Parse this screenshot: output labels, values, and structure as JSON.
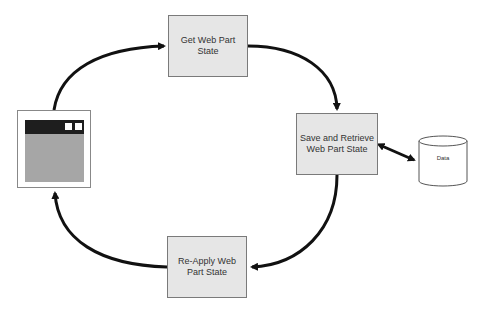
{
  "diagram": {
    "nodes": {
      "get_state": "Get Web Part State",
      "save_retrieve": "Save and Retrieve Web Part State",
      "reapply": "Re-Apply Web Part State",
      "data_store": "Data",
      "web_part_window": "Web Part"
    },
    "edges": [
      {
        "from": "web_part_window",
        "to": "get_state"
      },
      {
        "from": "get_state",
        "to": "save_retrieve"
      },
      {
        "from": "save_retrieve",
        "to": "data_store",
        "bidirectional": true
      },
      {
        "from": "save_retrieve",
        "to": "reapply"
      },
      {
        "from": "reapply",
        "to": "web_part_window"
      }
    ],
    "colors": {
      "box_fill": "#e6e6e6",
      "box_border": "#7a7a7a",
      "arrow": "#111111",
      "window_bar": "#1e1e1e",
      "window_body": "#a6a6a6"
    }
  }
}
